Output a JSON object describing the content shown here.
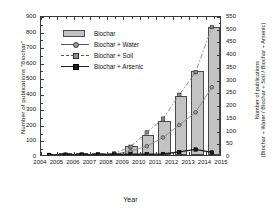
{
  "chart_data": {
    "type": "bar",
    "title": "",
    "subtitle": "",
    "xlabel": "Year",
    "ylabel": "Number of publications \"Biochar\"",
    "ylabel_right": "Number of publications (Biochar + Water / Biochar + Soil / Biochar + Arsenic)",
    "ylabel_right_line1": "Number of publications",
    "ylabel_right_line2": "(Biochar + Water / Biochar + Soil / Biochar + Arsenic)",
    "categories": [
      2004,
      2005,
      2006,
      2007,
      2008,
      2009,
      2010,
      2011,
      2012,
      2013,
      2014
    ],
    "x": [
      2004,
      2005,
      2006,
      2007,
      2008,
      2009,
      2010,
      2011,
      2012,
      2013,
      2014
    ],
    "xlim": [
      2004,
      2015
    ],
    "xticks": [
      2004,
      2005,
      2006,
      2007,
      2008,
      2009,
      2010,
      2011,
      2012,
      2013,
      2014,
      2015
    ],
    "xtick_labels": [
      "2004",
      "2005",
      "2006",
      "2007",
      "2008",
      "2009",
      "2010",
      "2011",
      "2012",
      "2013",
      "2014",
      "2015"
    ],
    "ylim": [
      0,
      900
    ],
    "yticks": [
      0,
      100,
      200,
      300,
      400,
      500,
      600,
      700,
      800,
      900
    ],
    "ytick_labels": [
      "0",
      "100",
      "200",
      "300",
      "400",
      "500",
      "600",
      "700",
      "800",
      "900"
    ],
    "ylim_right": [
      0,
      550
    ],
    "yticks_right": [
      0,
      50,
      100,
      150,
      200,
      250,
      300,
      350,
      400,
      450,
      500,
      550
    ],
    "ytick_labels_right": [
      "0",
      "50",
      "100",
      "150",
      "200",
      "250",
      "300",
      "350",
      "400",
      "450",
      "500",
      "550"
    ],
    "grid": false,
    "legend_position": "upper left inside",
    "series": [
      {
        "name": "Biochar",
        "kind": "bar",
        "axis": "left",
        "color": "#c3c3c3",
        "edge_color": "#4a4a4a",
        "values": [
          0,
          1,
          2,
          3,
          6,
          60,
          130,
          220,
          380,
          540,
          820
        ]
      },
      {
        "name": "Biochar + Water",
        "kind": "line",
        "axis": "right",
        "marker": "circle",
        "line_style": "solid",
        "color": "#8a8a8a",
        "values": [
          0,
          1,
          1,
          2,
          4,
          15,
          35,
          70,
          120,
          170,
          270
        ]
      },
      {
        "name": "Biochar + Soil",
        "kind": "line",
        "axis": "right",
        "marker": "square",
        "line_style": "dash-dot",
        "color": "#7d7d7d",
        "values": [
          0,
          1,
          2,
          3,
          6,
          33,
          90,
          145,
          240,
          330,
          510
        ]
      },
      {
        "name": "Biochar + Arsenic",
        "kind": "line",
        "axis": "right",
        "marker": "square-filled",
        "line_style": "solid",
        "color": "#1c1c1c",
        "values": [
          0,
          1,
          1,
          1,
          2,
          3,
          3,
          4,
          12,
          22,
          10
        ]
      }
    ],
    "legend": [
      {
        "label": "Biochar",
        "key": "bar-swatch"
      },
      {
        "label": "Biochar + Water",
        "key": "line-circle"
      },
      {
        "label": "Biochar + Soil",
        "key": "line-dashdot-square"
      },
      {
        "label": "Biochar + Arsenic",
        "key": "line-square-filled"
      }
    ]
  }
}
